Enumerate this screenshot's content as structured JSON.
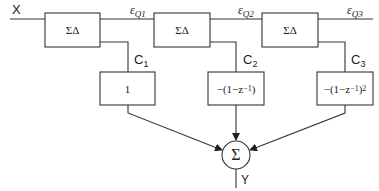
{
  "diagram": {
    "type": "MASH sigma-delta modulator block diagram",
    "input_label": "X",
    "output_label": "Y",
    "modulators": [
      {
        "label": "ΣΔ",
        "error_label": "ε",
        "error_sub": "Q1",
        "coef_label": "C",
        "coef_sub": "1",
        "filter_label": "1"
      },
      {
        "label": "ΣΔ",
        "error_label": "ε",
        "error_sub": "Q2",
        "coef_label": "C",
        "coef_sub": "2",
        "filter_label": "−(1−z",
        "filter_exp": "−1",
        "filter_tail": ")"
      },
      {
        "label": "ΣΔ",
        "error_label": "ε",
        "error_sub": "Q3",
        "coef_label": "C",
        "coef_sub": "3",
        "filter_label": "−(1−z",
        "filter_exp": "−1",
        "filter_tail": ")",
        "filter_power": "2"
      }
    ],
    "summer_label": "Σ",
    "colors": {
      "line": "#333333",
      "background": "#ffffff"
    }
  }
}
